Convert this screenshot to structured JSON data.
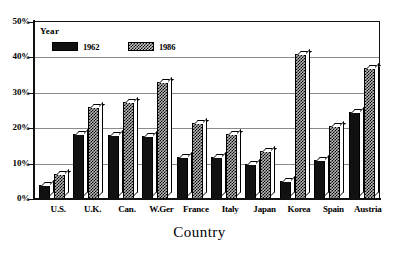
{
  "chart_data": {
    "type": "bar",
    "title": "",
    "xlabel": "Country",
    "ylabel": "",
    "ylim": [
      0,
      50
    ],
    "ytick_labels": [
      "0%",
      "10%",
      "20%",
      "30%",
      "40%",
      "50%"
    ],
    "ytick_values": [
      0,
      10,
      20,
      30,
      40,
      50
    ],
    "grid": true,
    "legend_title": "Year",
    "legend_position": "upper-left-inside",
    "categories": [
      "U.S.",
      "U.K.",
      "Can.",
      "W.Ger",
      "France",
      "Italy",
      "Japan",
      "Korea",
      "Spain",
      "Austria"
    ],
    "series": [
      {
        "name": "1962",
        "fill": "solid-black",
        "color": "#111111",
        "values": [
          4,
          18.5,
          18,
          17.8,
          12,
          12,
          10,
          5,
          11,
          24.5
        ]
      },
      {
        "name": "1986",
        "fill": "cross-hatch",
        "color": "#b9b9b9",
        "values": [
          7,
          26,
          27.5,
          33,
          21.5,
          18.5,
          13.5,
          41,
          20.5,
          37
        ]
      }
    ]
  }
}
